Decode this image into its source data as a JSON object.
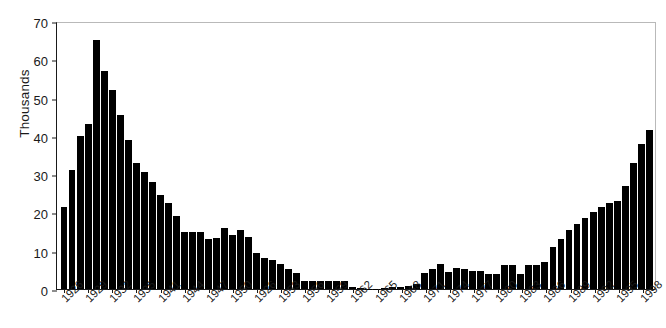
{
  "chart_data": {
    "type": "bar",
    "title": "",
    "subtitle": "",
    "xlabel": "",
    "ylabel": "Thousands",
    "ylim": [
      0,
      70
    ],
    "yticks": [
      0,
      10,
      20,
      30,
      40,
      50,
      60,
      70
    ],
    "ytick_labels": [
      "0",
      "10",
      "20",
      "30",
      "40",
      "50",
      "60",
      "70"
    ],
    "grid": false,
    "legend": null,
    "bar_color": "#000000",
    "axis_color": "#1a1a1a",
    "frame_color": "#b9b9b9",
    "categories": [
      "1926",
      "1927",
      "1928",
      "1929",
      "1930",
      "1931",
      "1932",
      "1933",
      "1934",
      "1935",
      "1936",
      "1937",
      "1938",
      "1939",
      "1940",
      "1941",
      "1942",
      "1943",
      "1944",
      "1945",
      "1946",
      "1947",
      "1948",
      "1949",
      "1950",
      "1951",
      "1952",
      "1953",
      "1954",
      "1955",
      "1956",
      "1957",
      "1958",
      "1959",
      "1960",
      "1961",
      "1962",
      "1963",
      "1964",
      "1965",
      "1966",
      "1967",
      "1968",
      "1969",
      "1970",
      "1971",
      "1972",
      "1973",
      "1974",
      "1975",
      "1976",
      "1977",
      "1978",
      "1979",
      "1980",
      "1981",
      "1982",
      "1983",
      "1984",
      "1985",
      "1986",
      "1987",
      "1988",
      "1989",
      "1990",
      "1991",
      "1992",
      "1993",
      "1994",
      "1995",
      "1996",
      "1997",
      "1998",
      "1999"
    ],
    "values": [
      21.5,
      31.0,
      40.0,
      43.0,
      65.0,
      57.0,
      52.0,
      45.5,
      39.0,
      33.0,
      30.5,
      28.0,
      24.5,
      22.5,
      19.0,
      15.0,
      14.8,
      15.0,
      13.0,
      13.2,
      16.0,
      14.0,
      15.5,
      13.5,
      9.5,
      8.0,
      7.5,
      6.5,
      5.3,
      4.3,
      2.2,
      2.2,
      2.2,
      2.2,
      2.2,
      2.2,
      0.5,
      0.2,
      0.1,
      0.1,
      0.3,
      0.4,
      0.6,
      0.8,
      1.2,
      4.2,
      5.2,
      6.5,
      4.5,
      5.5,
      5.3,
      4.8,
      4.6,
      4.0,
      3.8,
      6.2,
      6.2,
      4.0,
      6.2,
      6.2,
      7.0,
      11.0,
      13.0,
      15.5,
      17.0,
      18.5,
      20.0,
      21.5,
      22.5,
      23.0,
      27.0,
      33.0,
      38.0,
      41.5
    ],
    "xtick_positions": [
      0,
      3,
      6,
      9,
      12,
      15,
      18,
      21,
      24,
      27,
      30,
      33,
      36,
      39,
      42,
      45,
      48,
      51,
      54,
      57,
      60,
      63,
      66,
      69,
      72
    ],
    "xtick_labels": [
      "1926",
      "1929",
      "1932",
      "1935",
      "1941",
      "1944",
      "1947",
      "1950",
      "1926",
      "1953",
      "1956",
      "1959",
      "1962",
      "1965",
      "1968",
      "1971",
      "1974",
      "1977",
      "1980",
      "1983",
      "1986",
      "1989",
      "1992",
      "1995",
      "1998"
    ]
  }
}
